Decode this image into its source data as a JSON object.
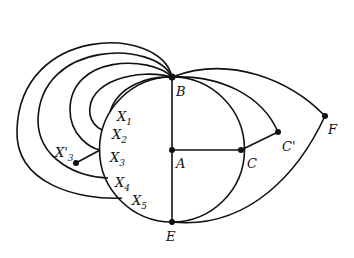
{
  "diagram": {
    "type": "graph",
    "vertices": [
      {
        "id": "B",
        "label": "B",
        "x": 172,
        "y": 77
      },
      {
        "id": "A",
        "label": "A",
        "x": 172,
        "y": 150
      },
      {
        "id": "E",
        "label": "E",
        "x": 172,
        "y": 222
      },
      {
        "id": "C",
        "label": "C",
        "x": 241,
        "y": 150
      },
      {
        "id": "C'",
        "label": "C'",
        "x": 278,
        "y": 132
      },
      {
        "id": "F",
        "label": "F",
        "x": 325,
        "y": 116
      },
      {
        "id": "X1",
        "label": "X",
        "sub": "1",
        "x": 110,
        "y": 112
      },
      {
        "id": "X2",
        "label": "X",
        "sub": "2",
        "x": 102,
        "y": 130
      },
      {
        "id": "X3",
        "label": "X",
        "sub": "3",
        "x": 100,
        "y": 150
      },
      {
        "id": "X'3",
        "label": "X'",
        "sub": "3",
        "x": 76,
        "y": 163
      },
      {
        "id": "X4",
        "label": "X",
        "sub": "4",
        "x": 108,
        "y": 178
      },
      {
        "id": "X5",
        "label": "X",
        "sub": "5",
        "x": 122,
        "y": 198
      }
    ],
    "edges": [
      [
        "B",
        "A"
      ],
      [
        "A",
        "E"
      ],
      [
        "A",
        "C"
      ],
      [
        "C",
        "C'"
      ],
      [
        "B",
        "C'"
      ],
      [
        "B",
        "F"
      ],
      [
        "F",
        "E"
      ],
      [
        "B",
        "C",
        "arc"
      ],
      [
        "C",
        "E",
        "arc"
      ],
      [
        "B",
        "E",
        "left-arc"
      ],
      [
        "B",
        "X1"
      ],
      [
        "B",
        "X2"
      ],
      [
        "B",
        "X3"
      ],
      [
        "B",
        "X4"
      ],
      [
        "B",
        "X5"
      ],
      [
        "X3",
        "X'3"
      ]
    ],
    "labels": {
      "B": "B",
      "A": "A",
      "E": "E",
      "C": "C",
      "Cp": "C'",
      "F": "F",
      "X": "X",
      "Xp": "X'",
      "s1": "1",
      "s2": "2",
      "s3": "3",
      "s4": "4",
      "s5": "5"
    }
  }
}
